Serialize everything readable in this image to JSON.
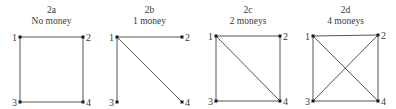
{
  "panels": [
    {
      "id": "2a",
      "title": "2a",
      "subtitle": "No money",
      "nodes": [
        {
          "label": "1",
          "x": 20,
          "y": 37
        },
        {
          "label": "2",
          "x": 83,
          "y": 37
        },
        {
          "label": "3",
          "x": 20,
          "y": 102
        },
        {
          "label": "4",
          "x": 83,
          "y": 102
        }
      ],
      "edges": [
        [
          1,
          2
        ],
        [
          1,
          3
        ],
        [
          2,
          4
        ],
        [
          3,
          4
        ]
      ]
    },
    {
      "id": "2b",
      "title": "2b",
      "subtitle": "1 money",
      "nodes": [
        {
          "label": "1",
          "x": 117,
          "y": 37
        },
        {
          "label": "2",
          "x": 182,
          "y": 37
        },
        {
          "label": "3",
          "x": 117,
          "y": 102
        },
        {
          "label": "4",
          "x": 182,
          "y": 102
        }
      ],
      "edges": [
        [
          1,
          2
        ],
        [
          1,
          3
        ],
        [
          1,
          4
        ]
      ]
    },
    {
      "id": "2c",
      "title": "2c",
      "subtitle": "2 moneys",
      "nodes": [
        {
          "label": "1",
          "x": 216,
          "y": 36
        },
        {
          "label": "2",
          "x": 280,
          "y": 36
        },
        {
          "label": "3",
          "x": 216,
          "y": 101
        },
        {
          "label": "4",
          "x": 280,
          "y": 101
        }
      ],
      "edges": [
        [
          1,
          2
        ],
        [
          1,
          3
        ],
        [
          2,
          4
        ],
        [
          3,
          4
        ],
        [
          1,
          4
        ]
      ]
    },
    {
      "id": "2d",
      "title": "2d",
      "subtitle": "4 moneys",
      "nodes": [
        {
          "label": "1",
          "x": 313,
          "y": 36
        },
        {
          "label": "2",
          "x": 378,
          "y": 35
        },
        {
          "label": "3",
          "x": 313,
          "y": 101
        },
        {
          "label": "4",
          "x": 378,
          "y": 101
        }
      ],
      "edges": [
        [
          1,
          2
        ],
        [
          1,
          3
        ],
        [
          2,
          4
        ],
        [
          3,
          4
        ],
        [
          1,
          4
        ],
        [
          2,
          3
        ]
      ]
    }
  ]
}
